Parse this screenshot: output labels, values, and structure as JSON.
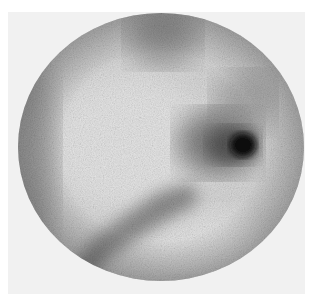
{
  "image": {
    "type": "scintigraphy",
    "description": "Circular grayscale gamma-camera scan with a dark focal hot spot on the right and diagonal band of uptake at lower left",
    "colors": {
      "background": "#ffffff",
      "frame": "#f1f1f1",
      "field_base": "#cfcfcf",
      "hot_spot": "#111111"
    },
    "features": [
      {
        "name": "hot-spot",
        "cx": 225,
        "cy": 133
      },
      {
        "name": "halo",
        "cx": 205,
        "cy": 125
      },
      {
        "name": "upper-band",
        "cx": 145,
        "cy": 30
      },
      {
        "name": "lower-diagonal-band",
        "cx": 100,
        "cy": 205
      },
      {
        "name": "right-upper-shadow",
        "cx": 225,
        "cy": 80
      }
    ]
  }
}
